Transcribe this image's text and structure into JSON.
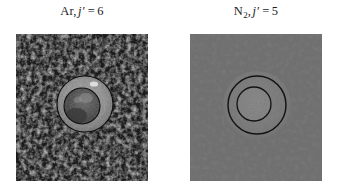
{
  "figure": {
    "background_color": "#ffffff",
    "width": 340,
    "height": 194,
    "panel_count": 2
  },
  "panels": [
    {
      "id": "ar-image",
      "caption": {
        "species": "Ar",
        "subscript": "",
        "separator": ",",
        "quantum_number": "j",
        "prime": "′",
        "equals": "=",
        "value": "6",
        "full_text": "Ar, j′ = 6"
      },
      "image": {
        "name": "ion-image-ar",
        "description": "velocity-map ion image, coarse high-contrast speckle",
        "background_color": "#1d1d1d",
        "speckle_color": "#7b7b7b",
        "texture": "coarse-blob",
        "rings": [
          {
            "name": "outer-ring",
            "cx": 69,
            "cy": 70,
            "r": 28,
            "fill": "#8c8c8c",
            "stroke": "#111111"
          },
          {
            "name": "inner-disk",
            "cx": 66,
            "cy": 72,
            "r": 18,
            "fill": "#525252",
            "stroke": "#111111"
          }
        ]
      }
    },
    {
      "id": "n2-image",
      "caption": {
        "species": "N",
        "subscript": "2",
        "separator": ",",
        "quantum_number": "j",
        "prime": "′",
        "equals": "=",
        "value": "5",
        "full_text": "N₂, j′ = 5"
      },
      "image": {
        "name": "ion-image-n2",
        "description": "velocity-map ion image, fine uniform grey speckle",
        "background_color": "#6d6d6d",
        "speckle_color": "#3a3a3a",
        "texture": "fine-grain",
        "rings": [
          {
            "name": "outer-ring",
            "cx": 67,
            "cy": 71,
            "r": 29,
            "fill": "none",
            "stroke": "#141414"
          },
          {
            "name": "inner-ring",
            "cx": 64,
            "cy": 70,
            "r": 17,
            "fill": "none",
            "stroke": "#141414"
          }
        ]
      }
    }
  ],
  "colors": {
    "text": "#1b1b1b",
    "page_background": "#ffffff",
    "panel_left_base": "#1d1d1d",
    "panel_right_base": "#6d6d6d",
    "ring_stroke": "#111111"
  }
}
